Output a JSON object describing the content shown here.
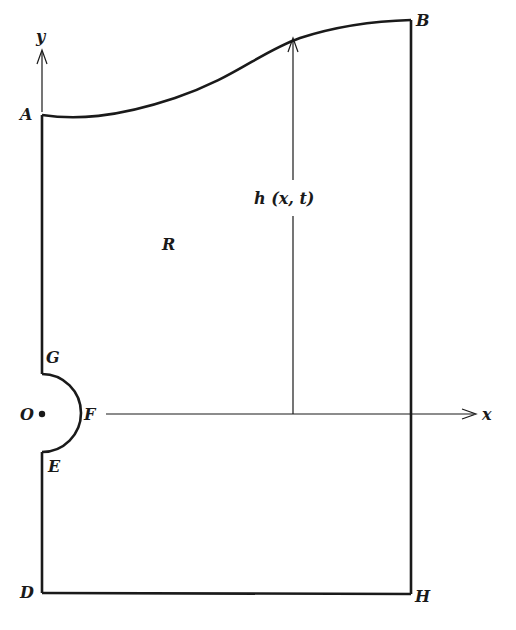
{
  "diagram": {
    "type": "domain-boundary-figure",
    "labels": {
      "y_axis": "y",
      "x_axis": "x",
      "A": "A",
      "B": "B",
      "D": "D",
      "H": "H",
      "G": "G",
      "E": "E",
      "F": "F",
      "O": "O",
      "region": "R",
      "height": "h (x, t)"
    },
    "colors": {
      "ink": "#1a1a1a",
      "background": "#ffffff"
    }
  }
}
